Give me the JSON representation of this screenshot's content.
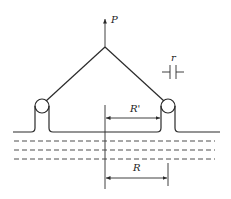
{
  "diagram": {
    "type": "pulley-support-frame",
    "labels": {
      "force": "P",
      "gap": "r",
      "inner_radius": "R'",
      "outer_radius": "R"
    },
    "elements": [
      "apex-frame",
      "force-arrow",
      "left-pulley",
      "right-pulley",
      "surface-line",
      "center-axis",
      "dashed-layers",
      "gap-symbol",
      "dimension-r-prime",
      "dimension-r"
    ],
    "dashed_layer_count": 3,
    "colors": {
      "line": "#2a2a2a",
      "background": "#ffffff"
    }
  }
}
